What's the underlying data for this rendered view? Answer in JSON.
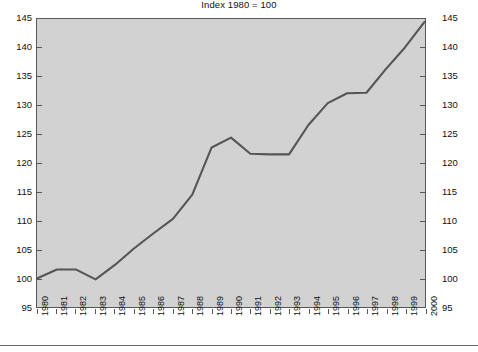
{
  "subtitle": "Index 1980 = 100",
  "axes": {
    "y_ticks": [
      "145",
      "140",
      "135",
      "130",
      "125",
      "120",
      "115",
      "110",
      "105",
      "100",
      "95"
    ],
    "x_ticks": [
      "1980",
      "1981",
      "1982",
      "1983",
      "1984",
      "1985",
      "1986",
      "1987",
      "1988",
      "1989",
      "1990",
      "1991",
      "1992",
      "1993",
      "1994",
      "1995",
      "1996",
      "1997",
      "1998",
      "1999",
      "2000"
    ]
  },
  "colors": {
    "plot_background": "#d2d2d2",
    "frame": "#585858",
    "series_line": "#555555",
    "page_background": "#ffffff",
    "text": "#111111"
  },
  "chart_data": {
    "type": "line",
    "title": "",
    "subtitle": "Index 1980 = 100",
    "xlabel": "",
    "ylabel": "",
    "ylim": [
      95,
      145
    ],
    "xlim": [
      "1980",
      "2000"
    ],
    "grid": false,
    "legend": "none",
    "dual_y_axis": true,
    "y_tick_step": 5,
    "categories": [
      "1980",
      "1981",
      "1982",
      "1983",
      "1984",
      "1985",
      "1986",
      "1987",
      "1988",
      "1989",
      "1990",
      "1991",
      "1992",
      "1993",
      "1994",
      "1995",
      "1996",
      "1997",
      "1998",
      "1999",
      "2000"
    ],
    "series": [
      {
        "name": "Index",
        "values": [
          100.0,
          101.5,
          101.5,
          99.8,
          102.3,
          105.2,
          107.8,
          110.3,
          114.5,
          122.7,
          124.4,
          121.6,
          121.5,
          121.5,
          126.6,
          130.4,
          132.1,
          132.2,
          136.3,
          140.1,
          144.5
        ]
      }
    ]
  }
}
